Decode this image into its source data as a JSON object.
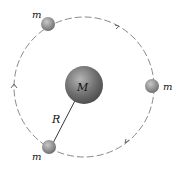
{
  "diagram": {
    "central_mass_label": "M",
    "radius_label": "R",
    "orbiting_masses": [
      {
        "label": "m",
        "position": "top-left"
      },
      {
        "label": "m",
        "position": "right"
      },
      {
        "label": "m",
        "position": "bottom-left"
      }
    ],
    "colors": {
      "orbit": "#888888",
      "sphere": "#7a7a7a",
      "line": "#222222"
    }
  }
}
